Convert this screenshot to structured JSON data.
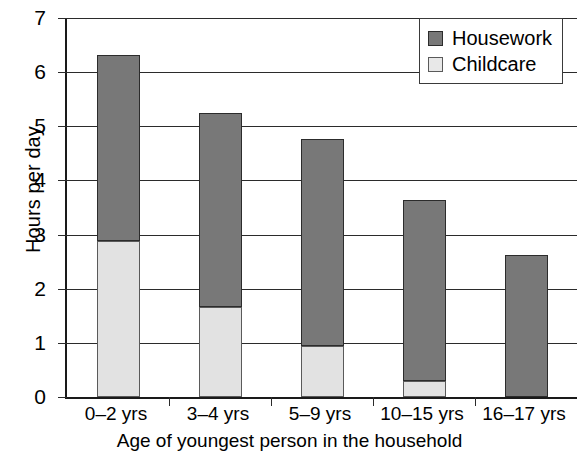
{
  "chart_data": {
    "type": "bar",
    "subtype": "stacked-vertical",
    "title": "",
    "xlabel": "Age of youngest person in the household",
    "ylabel": "Hours per day",
    "categories": [
      "0–2 yrs",
      "3–4 yrs",
      "5–9 yrs",
      "10–15 yrs",
      "16–17 yrs"
    ],
    "series": [
      {
        "name": "Childcare",
        "color": "#e2e2e2",
        "values": [
          2.88,
          1.67,
          0.94,
          0.3,
          0
        ]
      },
      {
        "name": "Housework",
        "color": "#787878",
        "values": [
          3.43,
          3.58,
          3.82,
          3.33,
          2.62
        ]
      }
    ],
    "totals": [
      6.31,
      5.25,
      4.76,
      3.63,
      2.62
    ],
    "ylim": [
      0,
      7
    ],
    "yticks": [
      0,
      1,
      2,
      3,
      4,
      5,
      6,
      7
    ],
    "ytick_labels": [
      "0",
      "1",
      "2",
      "3",
      "4",
      "5",
      "6",
      "7"
    ],
    "grid": true,
    "grid_axis": "y",
    "legend_position": "top-right",
    "legend_entries": [
      "Housework",
      "Childcare"
    ]
  },
  "axes": {
    "y_title": "Hours per day",
    "x_title": "Age of youngest person in the household"
  },
  "legend": {
    "items": [
      {
        "label": "Housework",
        "swatch": "dark-gray-swatch"
      },
      {
        "label": "Childcare",
        "swatch": "light-gray-swatch"
      }
    ]
  },
  "colors": {
    "housework": "#787878",
    "childcare": "#e2e2e2",
    "axis": "#1a1a1a",
    "grid": "#2b2b2b",
    "background": "#ffffff"
  }
}
